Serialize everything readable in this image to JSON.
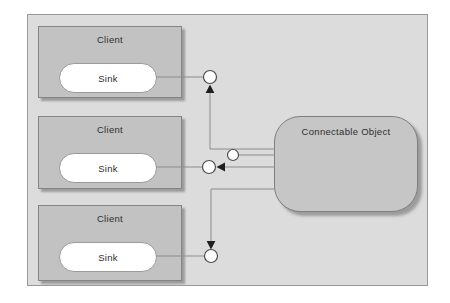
{
  "clients": [
    {
      "label": "Client",
      "sink": "Sink"
    },
    {
      "label": "Client",
      "sink": "Sink"
    },
    {
      "label": "Client",
      "sink": "Sink"
    }
  ],
  "object": {
    "label": "Connectable Object"
  },
  "colors": {
    "page_bg": "#ffffff",
    "frame_bg": "#dcdcdc",
    "frame_border": "#999999",
    "client_fill": "#c2c2c2",
    "client_border": "#848484",
    "object_fill": "#c6c6c6",
    "object_border": "#7f7f7f",
    "sink_fill": "#ffffff",
    "sink_border": "#9a9a9a",
    "connector": "#8c8c8c",
    "node_stroke": "#4d4d4d",
    "arrow": "#1f1f1f",
    "shadow": "#9c9c9c",
    "text": "#2e2e2e"
  }
}
